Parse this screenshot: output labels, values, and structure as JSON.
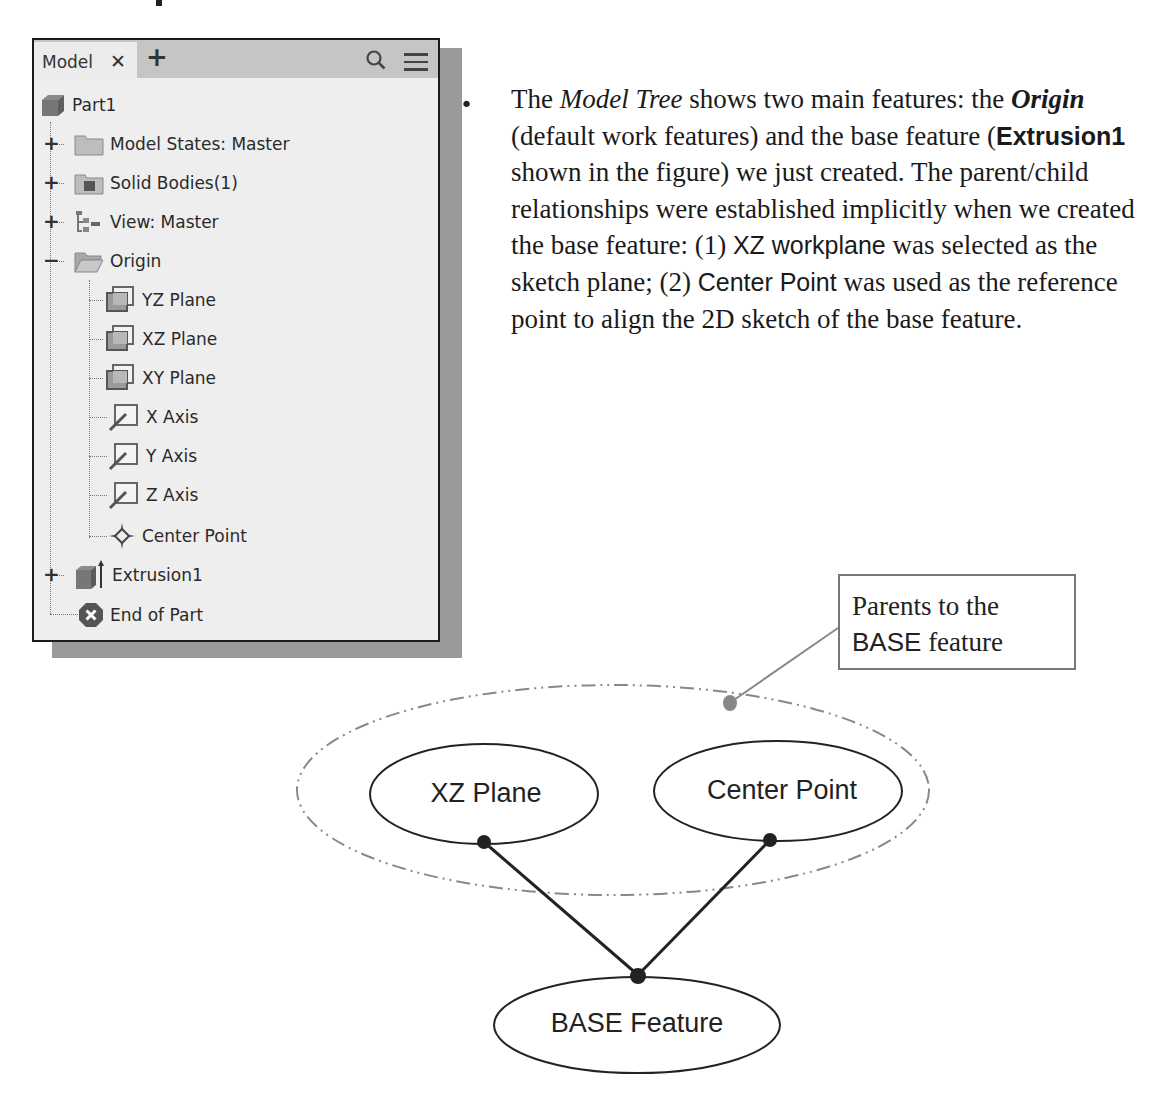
{
  "panel": {
    "tab_label": "Model",
    "tab_close_glyph": "✕",
    "tab_add_glyph": "+",
    "tree": [
      {
        "label": "Part1",
        "icon": "part-icon",
        "expander": ""
      },
      {
        "label": "Model States: Master",
        "icon": "folder-icon",
        "expander": "+"
      },
      {
        "label": "Solid Bodies(1)",
        "icon": "solid-bodies-folder-icon",
        "expander": "+"
      },
      {
        "label": "View: Master",
        "icon": "view-rep-icon",
        "expander": "+"
      },
      {
        "label": "Origin",
        "icon": "open-folder-icon",
        "expander": "−"
      },
      {
        "label": "YZ Plane",
        "icon": "plane-icon",
        "expander": ""
      },
      {
        "label": "XZ Plane",
        "icon": "plane-icon",
        "expander": ""
      },
      {
        "label": "XY Plane",
        "icon": "plane-icon",
        "expander": ""
      },
      {
        "label": "X Axis",
        "icon": "axis-icon",
        "expander": ""
      },
      {
        "label": "Y Axis",
        "icon": "axis-icon",
        "expander": ""
      },
      {
        "label": "Z Axis",
        "icon": "axis-icon",
        "expander": ""
      },
      {
        "label": "Center Point",
        "icon": "point-icon",
        "expander": ""
      },
      {
        "label": "Extrusion1",
        "icon": "extrusion-icon",
        "expander": "+"
      },
      {
        "label": "End of Part",
        "icon": "end-of-part-icon",
        "expander": ""
      }
    ]
  },
  "paragraph": {
    "bullet": "•",
    "s1": "The ",
    "s2_italic": "Model Tree",
    "s3": " shows two main features: the ",
    "s4_bolditalic": "Origin",
    "s5": " (default work features) and the base feature (",
    "s6_sansbold": "Extrusion1",
    "s7": " shown in the figure) we just created. The parent/child relationships were established implicitly when we created the base feature: (1) ",
    "s8_sans": "XZ workplane",
    "s9": " was selected as the sketch plane; (2) ",
    "s10_sans": "Center Point",
    "s11": " was used as the reference point to align the 2D sketch of the base feature."
  },
  "diagram": {
    "callout_line1": "Parents to the",
    "callout_line2_sans": "BASE",
    "callout_line2_rest": " feature",
    "nodes": {
      "xz_plane": "XZ Plane",
      "center_point": "Center Point",
      "base_feature": "BASE Feature"
    },
    "colors": {
      "line": "#222222",
      "group_outline": "#888888",
      "leader": "#888888"
    }
  }
}
